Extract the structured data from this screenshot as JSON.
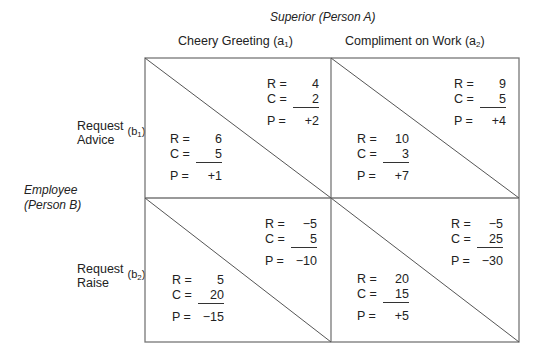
{
  "title": "Superior (Person A)",
  "row_title_line1": "Employee",
  "row_title_line2": "(Person B)",
  "columns": [
    {
      "label": "Cheery Greeting (a",
      "sub": "1",
      "close": ")"
    },
    {
      "label": "Compliment on Work (a",
      "sub": "2",
      "close": ")"
    }
  ],
  "rows": [
    {
      "line1": "Request",
      "line2": "Advice",
      "code": "(b",
      "sub": "1",
      "close": ")"
    },
    {
      "line1": "Request",
      "line2": "Raise",
      "code": "(b",
      "sub": "2",
      "close": ")"
    }
  ],
  "labels": {
    "r": "R =",
    "c": "C =",
    "p": "P ="
  },
  "cells": [
    {
      "superior": {
        "R": "4",
        "C": "2",
        "P": "+2"
      },
      "employee": {
        "R": "6",
        "C": "5",
        "P": "+1"
      }
    },
    {
      "superior": {
        "R": "9",
        "C": "5",
        "P": "+4"
      },
      "employee": {
        "R": "10",
        "C": "3",
        "P": "+7"
      }
    },
    {
      "superior": {
        "R": "−5",
        "C": "5",
        "P": "−10"
      },
      "employee": {
        "R": "5",
        "C": "20",
        "P": "−15"
      }
    },
    {
      "superior": {
        "R": "−5",
        "C": "25",
        "P": "−30"
      },
      "employee": {
        "R": "20",
        "C": "15",
        "P": "+5"
      }
    }
  ]
}
